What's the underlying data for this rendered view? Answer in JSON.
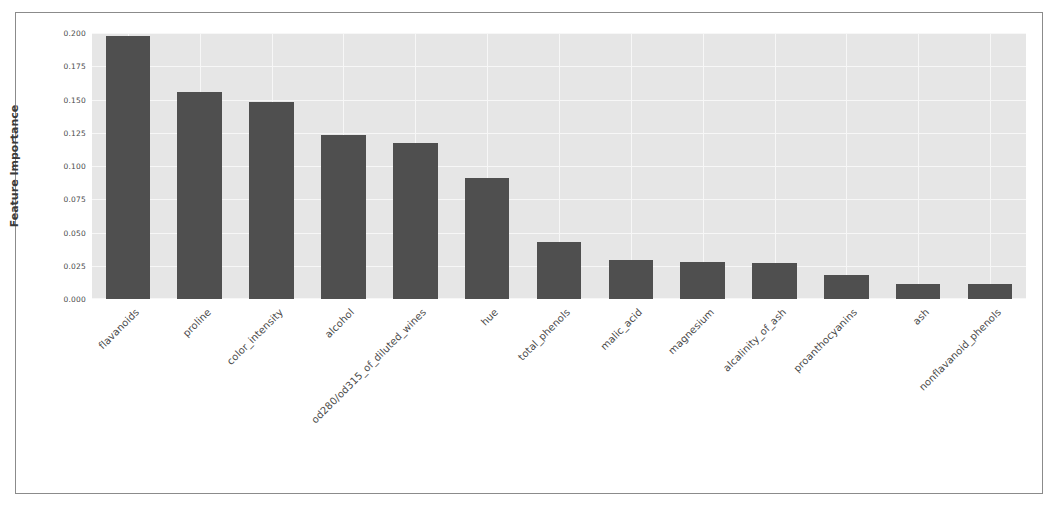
{
  "chart_data": {
    "type": "bar",
    "title": "",
    "xlabel": "",
    "ylabel": "Feature Importance",
    "ylim": [
      0.0,
      0.2
    ],
    "grid": true,
    "legend": "none",
    "orientation": "vertical",
    "bar_color": "#4f4f4f",
    "plot_background": "#e6e6e6",
    "gridline_color": "#f7f7f7",
    "yticks": [
      "0.000",
      "0.025",
      "0.050",
      "0.075",
      "0.100",
      "0.125",
      "0.150",
      "0.175",
      "0.200"
    ],
    "ytick_values": [
      0.0,
      0.025,
      0.05,
      0.075,
      0.1,
      0.125,
      0.15,
      0.175,
      0.2
    ],
    "categories": [
      "flavanoids",
      "proline",
      "color_intensity",
      "alcohol",
      "od280/od315_of_diluted_wines",
      "hue",
      "total_phenols",
      "malic_acid",
      "magnesium",
      "alcalinity_of_ash",
      "proanthocyanins",
      "ash",
      "nonflavanoid_phenols"
    ],
    "values": [
      0.198,
      0.156,
      0.148,
      0.123,
      0.117,
      0.091,
      0.043,
      0.029,
      0.028,
      0.027,
      0.018,
      0.011,
      0.011
    ]
  }
}
